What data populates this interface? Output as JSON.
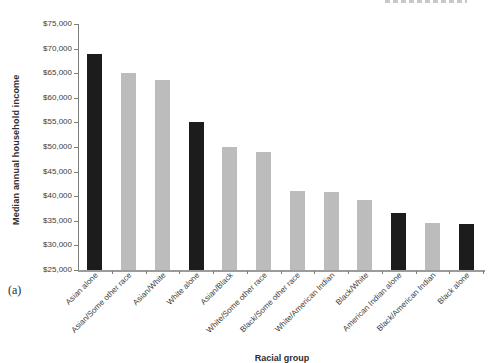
{
  "figure": {
    "panel_label": "(a)"
  },
  "chart_data": {
    "type": "bar",
    "title": "",
    "xlabel": "Racial group",
    "ylabel": "Median annual household income",
    "categories": [
      "Asian alone",
      "Asian/Some other race",
      "Asian/White",
      "White alone",
      "Asian/Black",
      "White/Some other race",
      "Black/Some other race",
      "White/American Indian",
      "Black/White",
      "American Indian alone",
      "Black/American Indian",
      "Black alone"
    ],
    "values": [
      69000,
      65100,
      63600,
      55000,
      50000,
      49000,
      41100,
      40900,
      39200,
      36600,
      34500,
      34300
    ],
    "bar_color_keys": [
      "black_bar",
      "gray_bar",
      "gray_bar",
      "black_bar",
      "gray_bar",
      "gray_bar",
      "gray_bar",
      "gray_bar",
      "gray_bar",
      "black_bar",
      "gray_bar",
      "black_bar"
    ],
    "ylim": [
      25000,
      75000
    ],
    "ytick_step": 5000,
    "ytick_labels": [
      "$25,000",
      "$30,000",
      "$35,000",
      "$40,000",
      "$45,000",
      "$50,000",
      "$55,000",
      "$60,000",
      "$65,000",
      "$70,000",
      "$75,000"
    ],
    "grid": "off",
    "legend": "none",
    "colors": {
      "black_bar": "#1c1c1c",
      "gray_bar": "#bcbcbc",
      "axis": "#7d7d7d",
      "text": "#3c3c3c"
    }
  }
}
